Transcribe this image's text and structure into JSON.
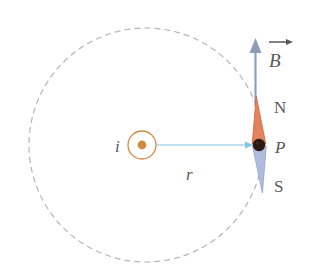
{
  "figure": {
    "background_color": "#ffffff",
    "width": 309,
    "height": 274
  },
  "colors": {
    "field_circle_dash": "#a8a8a8",
    "current_symbol": "#d18a40",
    "current_dot": "#d18a40",
    "radius_arrow": "#7fc4ec",
    "needle_north": "#e4815f",
    "needle_north_stroke": "#d86a4a",
    "needle_south": "#aab8dc",
    "needle_south_stroke": "#8f9ec9",
    "needle_pivot": "#2b1a12",
    "b_arrow": "#8d9bbd",
    "label_text": "#595959"
  },
  "elements": {
    "field_line": {
      "name": "magnetic-field-line",
      "style": "dashed-circle",
      "center": {
        "x": 146,
        "y": 145
      },
      "radius": 117
    },
    "wire": {
      "name": "current-out-of-page-symbol",
      "center": {
        "x": 142,
        "y": 145
      },
      "outer_radius": 14,
      "dot_radius": 4.5,
      "label": "i",
      "label_position": {
        "x": 118,
        "y": 151
      },
      "meaning": "current directed out of the page"
    },
    "radius": {
      "name": "radius-vector",
      "from": {
        "x": 157,
        "y": 145
      },
      "to": {
        "x": 252,
        "y": 145
      },
      "label": "r",
      "label_position": {
        "x": 190,
        "y": 177
      }
    },
    "compass_needle": {
      "name": "compass-needle",
      "pivot": {
        "x": 259,
        "y": 145
      },
      "north_tip": {
        "x": 256,
        "y": 97
      },
      "south_tip": {
        "x": 262,
        "y": 192
      },
      "half_width": 7,
      "north_label": "N",
      "north_label_position": {
        "x": 277,
        "y": 107
      },
      "point_label": "P",
      "point_label_position": {
        "x": 277,
        "y": 150
      },
      "south_label": "S",
      "south_label_position": {
        "x": 277,
        "y": 188
      }
    },
    "b_field_arrow": {
      "name": "magnetic-field-vector-arrow",
      "from": {
        "x": 255,
        "y": 105
      },
      "to": {
        "x": 255,
        "y": 40
      },
      "label": "B",
      "label_position": {
        "x": 272,
        "y": 64
      },
      "vector_bar": true,
      "vector_bar_from": {
        "x": 268,
        "y": 40
      },
      "vector_bar_to": {
        "x": 290,
        "y": 40
      }
    }
  },
  "labels": {
    "current": "i",
    "radius": "r",
    "north": "N",
    "point": "P",
    "south": "S",
    "field": "B"
  }
}
